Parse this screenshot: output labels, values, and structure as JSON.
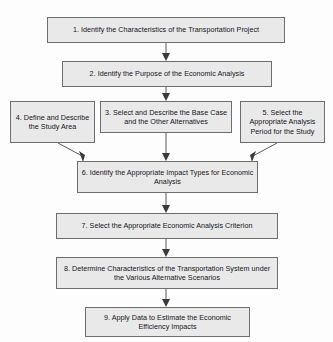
{
  "diagram": {
    "type": "flowchart",
    "orientation": "top-to-bottom",
    "background_color": "#fdfdfd",
    "node_fill_color": "#e9e9e9",
    "node_border_color": "#6e6e6e",
    "connector_color": "#5b5b5b",
    "text_color": "#15151a",
    "nodes": [
      {
        "id": "1",
        "label": "1. Identify the Characteristics of the Transportation Project"
      },
      {
        "id": "2",
        "label": "2. Identify the Purpose of the Economic Analysis"
      },
      {
        "id": "3",
        "label": "3. Select and Describe the Base Case and the Other Alternatives"
      },
      {
        "id": "4",
        "label": "4. Define and Describe the Study Area"
      },
      {
        "id": "5",
        "label": "5. Select the Appropriate Analysis Period for the Study"
      },
      {
        "id": "6",
        "label": "6. Identify the Appropriate Impact Types for Economic Analysis"
      },
      {
        "id": "7",
        "label": "7. Select the Appropriate Economic Analysis Criterion"
      },
      {
        "id": "8",
        "label": "8. Determine Characteristics of the Transportation System under the Various Alternative Scenarios"
      },
      {
        "id": "9",
        "label": "9. Apply Data to Estimate the Economic Efficiency Impacts"
      }
    ],
    "edges": [
      {
        "from": "1",
        "to": "2",
        "style": "straight-down-arrow"
      },
      {
        "from": "2",
        "to": "3",
        "style": "straight-down-arrow"
      },
      {
        "from": "3",
        "to": "6",
        "style": "straight-down-arrow"
      },
      {
        "from": "4",
        "to": "6",
        "style": "diagonal-arrow"
      },
      {
        "from": "5",
        "to": "6",
        "style": "diagonal-arrow"
      },
      {
        "from": "6",
        "to": "7",
        "style": "straight-down-arrow"
      },
      {
        "from": "7",
        "to": "8",
        "style": "straight-down-arrow"
      },
      {
        "from": "8",
        "to": "9",
        "style": "straight-down-arrow"
      }
    ]
  }
}
